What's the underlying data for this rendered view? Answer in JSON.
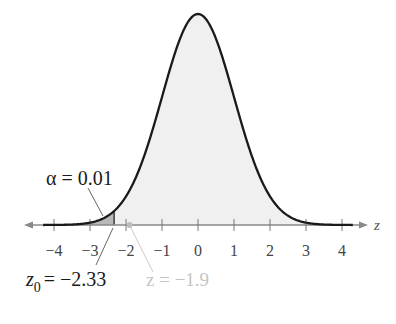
{
  "figure": {
    "type": "standard-normal-distribution",
    "axis_label": "z",
    "ticks": [
      {
        "value": -4,
        "label": "−4"
      },
      {
        "value": -3,
        "label": "−3"
      },
      {
        "value": -2,
        "label": "−2"
      },
      {
        "value": -1,
        "label": "−1"
      },
      {
        "value": 0,
        "label": "0"
      },
      {
        "value": 1,
        "label": "1"
      },
      {
        "value": 2,
        "label": "2"
      },
      {
        "value": 3,
        "label": "3"
      },
      {
        "value": 4,
        "label": "4"
      }
    ],
    "x_range": [
      -4.3,
      4.3
    ],
    "rejection_region": {
      "from": -4.3,
      "to": -2.33
    },
    "alpha_label": "α = 0.01",
    "critical_value": {
      "value": -2.33,
      "label_main": "= −2.33",
      "label_var": "z",
      "label_sub": "0"
    },
    "test_statistic": {
      "value": -1.9,
      "label": "z = −1.9"
    },
    "colors": {
      "curve": "#1a1a1a",
      "fill": "#f0f0f0",
      "rejection_fill": "#b8b8b8",
      "axis": "#888888",
      "test_stat": "#c4c4c4",
      "text": "#1a1a1a"
    }
  }
}
